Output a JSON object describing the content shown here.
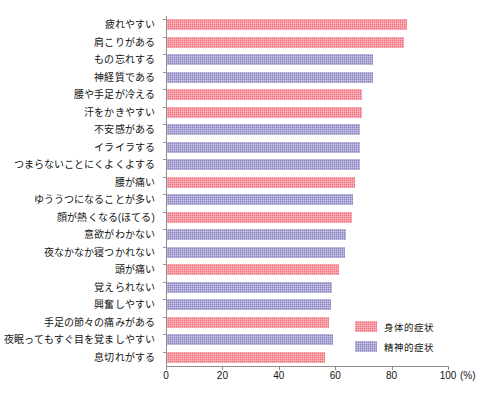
{
  "chart_data": {
    "type": "bar",
    "orientation": "horizontal",
    "title": "",
    "subtitle": "",
    "xlabel": "",
    "ylabel": "",
    "unit_label": "(%)",
    "xlim": [
      0,
      100
    ],
    "xticks": [
      0,
      20,
      40,
      60,
      80,
      100
    ],
    "xtick_labels": [
      "0",
      "20",
      "40",
      "60",
      "80",
      "100"
    ],
    "grid": false,
    "legend_position": "bottom-right",
    "colors": {
      "physical": "#f4707e",
      "mental": "#8a86c4",
      "axis": "#8d8d8d",
      "text": "#141414",
      "background": "#ffffff"
    },
    "legend": [
      {
        "key": "physical",
        "label": "身体的症状",
        "color": "#f4707e"
      },
      {
        "key": "mental",
        "label": "精神的症状",
        "color": "#8a86c4"
      }
    ],
    "categories": [
      "疲れやすい",
      "肩こりがある",
      "もの忘れする",
      "神経質である",
      "腰や手足が冷える",
      "汗をかきやすい",
      "不安感がある",
      "イライラする",
      "つまらないことにくよくよする",
      "腰が痛い",
      "ゆううつになることが多い",
      "顔が熱くなる(ほてる)",
      "意欲がわかない",
      "夜なかなか寝つかれない",
      "頭が痛い",
      "覚えられない",
      "興奮しやすい",
      "手足の節々の痛みがある",
      "夜眠ってもすぐ目を覚ましやすい",
      "息切れがする"
    ],
    "values": [
      85,
      84,
      73,
      73,
      69,
      69,
      68.5,
      68.5,
      68.5,
      66.5,
      66,
      65.5,
      63.5,
      63,
      61,
      58.5,
      58,
      57.5,
      59,
      56
    ],
    "series_keys": [
      "physical",
      "physical",
      "mental",
      "mental",
      "physical",
      "physical",
      "mental",
      "mental",
      "mental",
      "physical",
      "mental",
      "physical",
      "mental",
      "mental",
      "physical",
      "mental",
      "mental",
      "physical",
      "mental",
      "physical"
    ],
    "points": [
      {
        "category": "疲れやすい",
        "value": 85,
        "series": "physical"
      },
      {
        "category": "肩こりがある",
        "value": 84,
        "series": "physical"
      },
      {
        "category": "もの忘れする",
        "value": 73,
        "series": "mental"
      },
      {
        "category": "神経質である",
        "value": 73,
        "series": "mental"
      },
      {
        "category": "腰や手足が冷える",
        "value": 69,
        "series": "physical"
      },
      {
        "category": "汗をかきやすい",
        "value": 69,
        "series": "physical"
      },
      {
        "category": "不安感がある",
        "value": 68.5,
        "series": "mental"
      },
      {
        "category": "イライラする",
        "value": 68.5,
        "series": "mental"
      },
      {
        "category": "つまらないことにくよくよする",
        "value": 68.5,
        "series": "mental"
      },
      {
        "category": "腰が痛い",
        "value": 66.5,
        "series": "physical"
      },
      {
        "category": "ゆううつになることが多い",
        "value": 66,
        "series": "mental"
      },
      {
        "category": "顔が熱くなる(ほてる)",
        "value": 65.5,
        "series": "physical"
      },
      {
        "category": "意欲がわかない",
        "value": 63.5,
        "series": "mental"
      },
      {
        "category": "夜なかなか寝つかれない",
        "value": 63,
        "series": "mental"
      },
      {
        "category": "頭が痛い",
        "value": 61,
        "series": "physical"
      },
      {
        "category": "覚えられない",
        "value": 58.5,
        "series": "mental"
      },
      {
        "category": "興奮しやすい",
        "value": 58,
        "series": "mental"
      },
      {
        "category": "手足の節々の痛みがある",
        "value": 57.5,
        "series": "physical"
      },
      {
        "category": "夜眠ってもすぐ目を覚ましやすい",
        "value": 59,
        "series": "mental"
      },
      {
        "category": "息切れがする",
        "value": 56,
        "series": "physical"
      }
    ]
  }
}
